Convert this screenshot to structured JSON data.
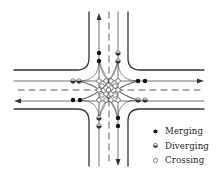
{
  "diagram": {
    "colors": {
      "line": "#333333",
      "background": "#ffffff"
    },
    "legend": [
      {
        "symbol": "filled-dot",
        "label": "Merging"
      },
      {
        "symbol": "half-filled-dot",
        "label": "Diverging"
      },
      {
        "symbol": "open-dot",
        "label": "Crossing"
      }
    ],
    "conflict_points": {
      "merging": 8,
      "diverging": 8,
      "crossing": 16
    }
  }
}
